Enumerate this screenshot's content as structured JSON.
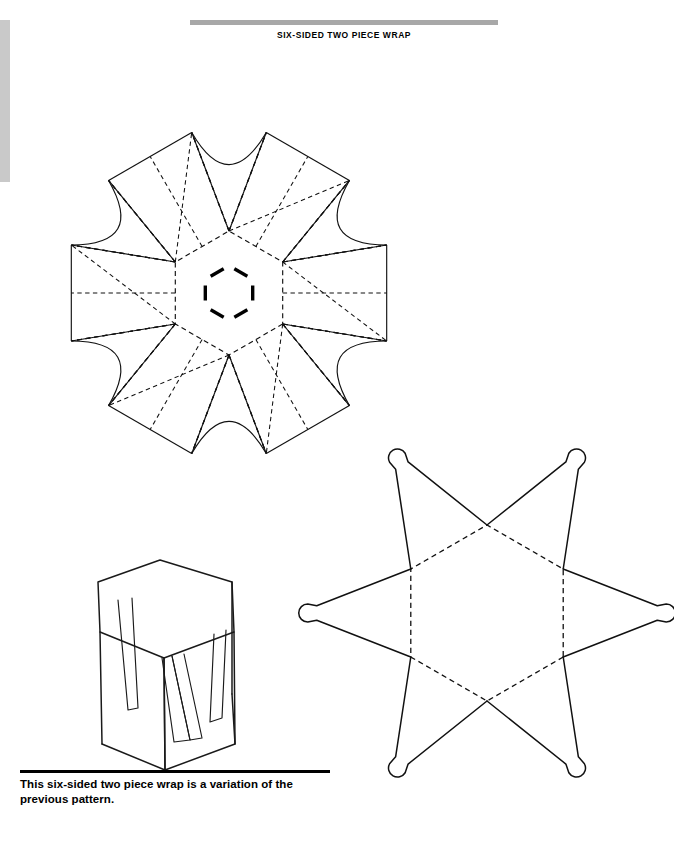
{
  "page": {
    "width": 674,
    "height": 848,
    "background": "#ffffff",
    "ink": "#111111"
  },
  "header": {
    "title": "SIX-SIDED TWO PIECE WRAP",
    "rule_color": "#a8a8a8"
  },
  "caption": {
    "text": "This six-sided two piece wrap is a variation of the previous pattern.",
    "rule_color": "#000000"
  },
  "edge_artifact": {
    "name": "scan-edge-strip",
    "color": "#c9c9c9"
  },
  "figures": [
    {
      "id": "wrap-flat-pattern",
      "label": "six-sided wrap flat pattern",
      "type": "die-line",
      "center": [
        229,
        293
      ],
      "hex_radius": 62,
      "hex_rotation_deg": 30,
      "flap_height": 104,
      "flap_top_half_width": 48,
      "arc_bulge": 13,
      "slot_offset": 30,
      "slot_length": 15,
      "notes": "central hexagon with six trapezoid flaps, concave arcs between flaps, dashed fold lines and diagonal creases, six tuck slots"
    },
    {
      "id": "star-flat-pattern",
      "label": "six-pointed star flat pattern",
      "type": "die-line",
      "center": [
        487,
        613
      ],
      "hex_radius": 88,
      "hex_rotation_deg": 30,
      "point_length": 108,
      "tip_radius": 9,
      "notes": "six-pointed star with rounded lollipop tips and dashed central hexagon fold"
    },
    {
      "id": "assembled-box",
      "label": "assembled hexagonal box perspective",
      "type": "perspective-sketch",
      "origin": [
        98,
        560
      ],
      "notes": "hexagonal prism with V-shaped flap cut-outs on visible faces"
    }
  ],
  "legend": {
    "cut_line": "solid",
    "fold_line": "dashed",
    "slot_mark": "solid thick bar"
  }
}
